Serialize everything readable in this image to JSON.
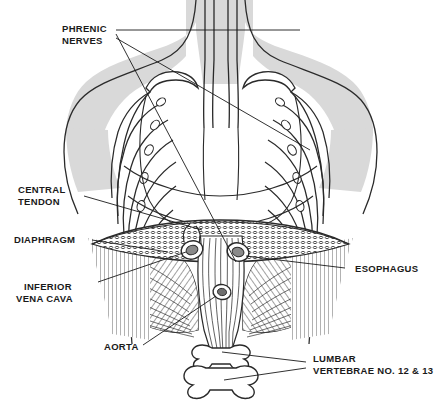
{
  "figure": {
    "background_color": "#ffffff",
    "ink_color": "#1a1a1a",
    "body_shading_color": "#d9d9d9",
    "muscle_shading_color": "#6f6f6f"
  },
  "labels": {
    "phrenic_nerves": {
      "line1": "PHRENIC",
      "line2": "NERVES"
    },
    "central_tendon": {
      "line1": "CENTRAL",
      "line2": "TENDON"
    },
    "diaphragm": {
      "line1": "DIAPHRAGM",
      "line2": ""
    },
    "inferior_vena_cava": {
      "line1": "INFERIOR",
      "line2": "VENA CAVA"
    },
    "aorta": {
      "line1": "AORTA",
      "line2": ""
    },
    "esophagus": {
      "line1": "ESOPHAGUS",
      "line2": ""
    },
    "lumbar_vertebrae": {
      "line1": "LUMBAR",
      "line2": "VERTEBRAE NO. 12 & 13"
    }
  }
}
